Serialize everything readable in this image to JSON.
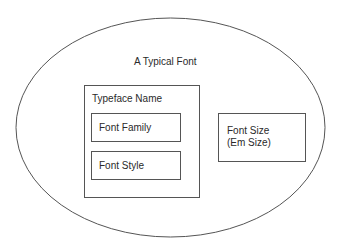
{
  "diagram": {
    "outer": {
      "label": "A Typical Font",
      "shape": "ellipse"
    },
    "typeface": {
      "label": "Typeface Name",
      "children": [
        {
          "label": "Font Family"
        },
        {
          "label": "Font Style"
        }
      ]
    },
    "size": {
      "line1": "Font Size",
      "line2": "(Em Size)"
    }
  },
  "colors": {
    "stroke": "#555555",
    "text": "#2a2a2a",
    "background": "#ffffff"
  }
}
